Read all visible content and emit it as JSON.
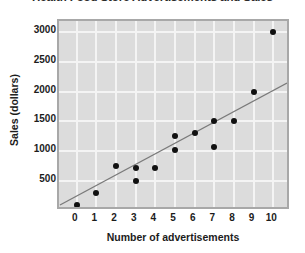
{
  "chart_data": {
    "type": "scatter",
    "title": "Health Food Store Advertisements and Sales",
    "xlabel": "Number of advertisements",
    "ylabel": "Sales (dollars)",
    "xlim": [
      -0.9,
      10.9
    ],
    "ylim": [
      0,
      3180
    ],
    "xticks": [
      0,
      1,
      2,
      3,
      4,
      5,
      6,
      7,
      8,
      9,
      10
    ],
    "xtick_labels": [
      "0",
      "1",
      "2",
      "3",
      "4",
      "5",
      "6",
      "7",
      "8",
      "9",
      "10"
    ],
    "yticks": [
      500,
      1000,
      1500,
      2000,
      2500,
      3000
    ],
    "ytick_labels": [
      "500",
      "1000",
      "1500",
      "2000",
      "2500",
      "3000"
    ],
    "grid": true,
    "legend": null,
    "plot_background_color": "#dcdcdc",
    "gridline_color": "#f4f4f4",
    "marker_color": "#111111",
    "trendline_color": "#7a7a7a",
    "points": [
      {
        "x": 0,
        "y": 100
      },
      {
        "x": 1,
        "y": 300
      },
      {
        "x": 2,
        "y": 750
      },
      {
        "x": 3,
        "y": 720
      },
      {
        "x": 3,
        "y": 500
      },
      {
        "x": 4,
        "y": 720
      },
      {
        "x": 5,
        "y": 1020
      },
      {
        "x": 5,
        "y": 1250
      },
      {
        "x": 6,
        "y": 1300
      },
      {
        "x": 7,
        "y": 1500
      },
      {
        "x": 7,
        "y": 1070
      },
      {
        "x": 8,
        "y": 1500
      },
      {
        "x": 9,
        "y": 2000
      },
      {
        "x": 10,
        "y": 3000
      }
    ],
    "trendline": {
      "label": "line of best fit",
      "x_start": -0.85,
      "y_start": 35,
      "x_end": 10.9,
      "y_end": 2120
    }
  }
}
